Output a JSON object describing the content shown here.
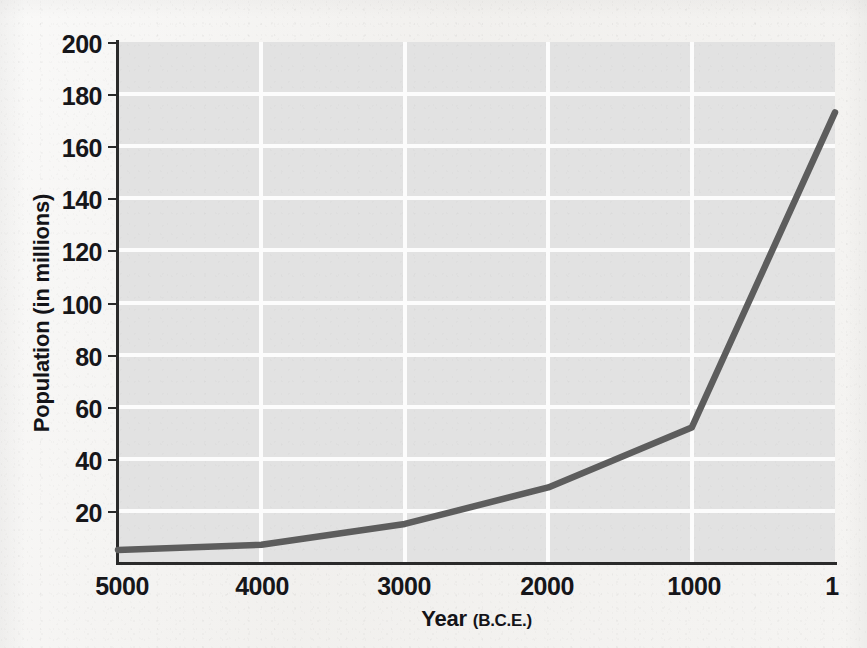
{
  "figure": {
    "background_color": "#f3f2f0",
    "plot_background_color": "#e2e2e2",
    "gridline_color": "#fcfcfc",
    "axis_color": "#2a2a2a",
    "line_color": "#5d5d5d"
  },
  "axes": {
    "y_title": "Population (in millions)",
    "x_title_main": "Year",
    "x_title_era": "(B.C.E.)",
    "y_ticks": [
      "200",
      "180",
      "160",
      "140",
      "120",
      "100",
      "80",
      "60",
      "40",
      "20"
    ],
    "x_ticks": [
      "5000",
      "4000",
      "3000",
      "2000",
      "1000",
      "1"
    ]
  },
  "chart_data": {
    "type": "line",
    "title": "",
    "subtitle": "",
    "xlabel": "Year (B.C.E.)",
    "ylabel": "Population (in millions)",
    "x": [
      5000,
      4000,
      3000,
      2000,
      1000,
      1
    ],
    "x_tick_labels": [
      "5000",
      "4000",
      "3000",
      "2000",
      "1000",
      "1"
    ],
    "x_axis_direction": "reversed",
    "values": [
      5,
      7,
      15,
      29,
      52,
      173
    ],
    "series": [
      {
        "name": "World population",
        "color": "#5d5d5d",
        "values": [
          5,
          7,
          15,
          29,
          52,
          173
        ]
      }
    ],
    "ylim": [
      0,
      200
    ],
    "y_ticks": [
      20,
      40,
      60,
      80,
      100,
      120,
      140,
      160,
      180,
      200
    ],
    "grid": "horizontal and vertical, white on gray",
    "legend": "none",
    "annotations": []
  }
}
